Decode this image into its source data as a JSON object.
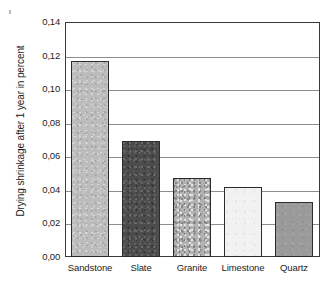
{
  "chart_data": {
    "type": "bar",
    "title": "",
    "xlabel": "",
    "ylabel": "Drying shrinkage after 1 year in percent",
    "categories": [
      "Sandstone",
      "Slate",
      "Granite",
      "Limestone",
      "Quartz"
    ],
    "values": [
      0.117,
      0.069,
      0.047,
      0.0415,
      0.0325
    ],
    "ylim": [
      0.0,
      0.14
    ],
    "ytick_labels": [
      "0,14",
      "0,12",
      "0,10",
      "0,08",
      "0,06",
      "0,04",
      "0,02",
      "0,00"
    ],
    "ytick_values": [
      0.14,
      0.12,
      0.1,
      0.08,
      0.06,
      0.04,
      0.02,
      0.0
    ],
    "grid": true,
    "legend": "none",
    "decimal_separator": ",",
    "series": [
      {
        "name": "Drying shrinkage after 1 year in percent",
        "values": [
          0.117,
          0.069,
          0.047,
          0.0415,
          0.0325
        ]
      }
    ],
    "bar_fills": [
      "#bcbcbc",
      "#4c4c4c",
      "#b2b2b2",
      "#f2f2f2",
      "#9a9a9a"
    ],
    "bar_textures": [
      "speckled-light",
      "speckled-dark",
      "speckled-medium",
      "plain-very-light",
      "plain-medium"
    ],
    "bar_edge_color": "#2b2b2b",
    "axis_color": "#3a3a3a",
    "grid_color": "#8e8e8e",
    "background_color": "#ffffff"
  }
}
